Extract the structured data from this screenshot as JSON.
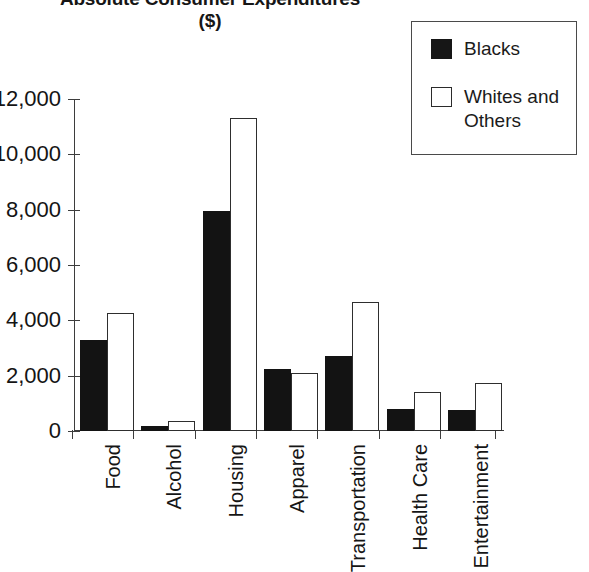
{
  "title": "Absolute Consumer Expenditures",
  "subtitle": "($)",
  "legend": {
    "entries": [
      {
        "label": "Blacks",
        "swatch": "filled-square-icon",
        "color": "#131313"
      },
      {
        "label": "Whites and Others",
        "swatch": "open-square-icon",
        "color": "#ffffff"
      }
    ]
  },
  "y_axis": {
    "ticks": [
      "12,000",
      "10,000",
      "8,000",
      "6,000",
      "4,000",
      "2,000",
      "0"
    ]
  },
  "chart_data": {
    "type": "bar",
    "xlabel": "",
    "ylabel": "",
    "ylim": [
      0,
      12000
    ],
    "ytick_values": [
      0,
      2000,
      4000,
      6000,
      8000,
      10000,
      12000
    ],
    "grid": false,
    "legend_position": "top-right",
    "categories": [
      "Food",
      "Alcohol",
      "Housing",
      "Apparel",
      "Transportation",
      "Health Care",
      "Entertainment"
    ],
    "series": [
      {
        "name": "Blacks",
        "color": "#131313",
        "values": [
          3280,
          180,
          7950,
          2250,
          2700,
          800,
          760
        ]
      },
      {
        "name": "Whites and Others",
        "color": "#ffffff",
        "values": [
          4250,
          370,
          11300,
          2100,
          4680,
          1400,
          1750
        ]
      }
    ]
  }
}
